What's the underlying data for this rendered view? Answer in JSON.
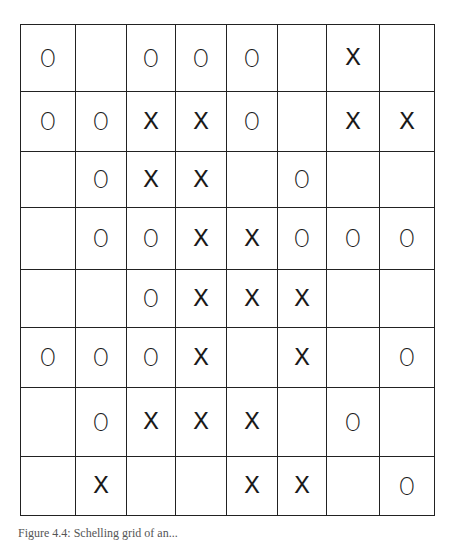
{
  "figure": {
    "caption": "Figure 4.4: Schelling grid of an..."
  },
  "grid": {
    "rows": 8,
    "cols": 8,
    "col_edges": [
      0,
      56,
      107,
      156,
      207,
      258,
      307,
      360,
      415
    ],
    "row_edges": [
      0,
      68,
      128,
      184,
      246,
      304,
      364,
      433,
      492
    ],
    "cells": [
      [
        "O",
        "",
        "O",
        "O",
        "O",
        "",
        "X",
        ""
      ],
      [
        "O",
        "O",
        "X",
        "X",
        "O",
        "",
        "X",
        "X"
      ],
      [
        "",
        "O",
        "X",
        "X",
        "",
        "O",
        "",
        ""
      ],
      [
        "",
        "O",
        "O",
        "X",
        "X",
        "O",
        "O",
        "O"
      ],
      [
        "",
        "",
        "O",
        "X",
        "X",
        "X",
        "",
        ""
      ],
      [
        "O",
        "O",
        "O",
        "X",
        "",
        "X",
        "",
        "O"
      ],
      [
        "",
        "O",
        "X",
        "X",
        "X",
        "",
        "O",
        ""
      ],
      [
        "",
        "X",
        "",
        "",
        "X",
        "X",
        "",
        "O"
      ]
    ]
  }
}
